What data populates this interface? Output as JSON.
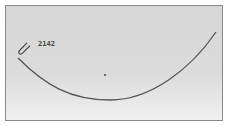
{
  "diagram": {
    "curve_label": "2142",
    "curve_color": "#555555",
    "marker": "pen-cursor-icon"
  }
}
